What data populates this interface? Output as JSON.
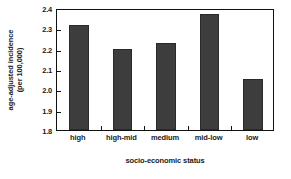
{
  "chart_data": {
    "type": "bar",
    "title": "",
    "categories": [
      "high",
      "high-mid",
      "medium",
      "mid-low",
      "low"
    ],
    "values": [
      2.315,
      2.2,
      2.23,
      2.37,
      2.05
    ],
    "series": [
      {
        "name": "age-adjusted incidence",
        "values": [
          2.315,
          2.2,
          2.23,
          2.37,
          2.05
        ]
      }
    ],
    "xlabel": "socio-economic status",
    "ylabel": "age-adjusted incidence (per 100,000)",
    "ylabel_line1": "age-adjusted incidence",
    "ylabel_line2": "(per 100,000)",
    "ylim": [
      1.8,
      2.4
    ],
    "ytick_values": [
      1.8,
      1.9,
      2.0,
      2.1,
      2.2,
      2.3,
      2.4
    ],
    "ytick_labels": [
      "1.8",
      "1.9",
      "2.0",
      "2.1",
      "2.2",
      "2.3",
      "2.4"
    ],
    "ytick_step": 0.1,
    "grid": false,
    "legend": false,
    "legend_position": "none",
    "bar_color": "#3d3d3d",
    "frame_color": "#111111",
    "background_color": "#ffffff",
    "bar_width_ratio": 0.45,
    "orientation": "vertical"
  }
}
